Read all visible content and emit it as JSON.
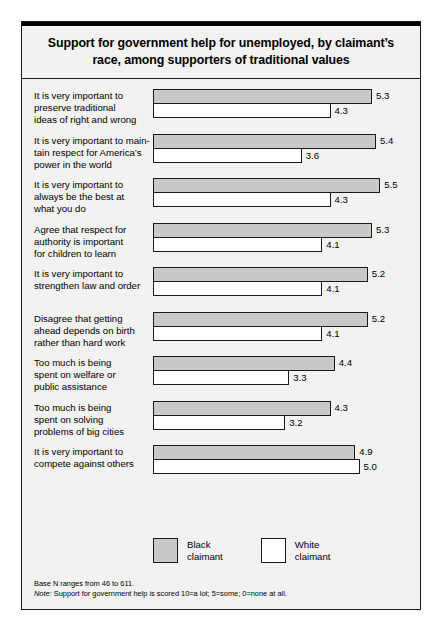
{
  "title": "Support for government help for unemployed, by claimant’s race, among supporters of traditional values",
  "legend": {
    "items": [
      {
        "label_line1": "Black",
        "label_line2": "claimant",
        "color": "#c9c9c7"
      },
      {
        "label_line1": "White",
        "label_line2": "claimant",
        "color": "#ffffff"
      }
    ]
  },
  "footnotes": {
    "base_n": "Base N ranges from 46 to 611.",
    "note_prefix": "Note:",
    "note_text": " Support for government help is scored 10=a lot; 5=some; 0=none at all."
  },
  "chart_data": {
    "type": "bar",
    "orientation": "horizontal",
    "title": "Support for government help for unemployed, by claimant’s race, among supporters of traditional values",
    "xlabel": "",
    "ylabel": "",
    "xlim": [
      0,
      5.8
    ],
    "grid": false,
    "legend_position": "bottom",
    "categories": [
      "It is very important to preserve traditional ideas of right and wrong",
      "It is very important to maintain respect for America’s power in the world",
      "It is very important to always be the best at what you do",
      "Agree that respect for authority is important for children to learn",
      "It is very important to strengthen law and order",
      "Disagree that getting ahead depends on birth rather than hard work",
      "Too much is being spent on welfare or public assistance",
      "Too much is being spent on solving problems of big cities",
      "It is very important to compete against others"
    ],
    "category_lines": [
      [
        "It is very important to",
        "preserve traditional",
        "ideas of right and wrong"
      ],
      [
        "It is very important to main-",
        "tain respect for America’s",
        "power in the world"
      ],
      [
        "It is very important to",
        "always be the best at",
        "what you do"
      ],
      [
        "Agree that respect for",
        "authority is important",
        "for children to learn"
      ],
      [
        "It is very important to",
        "strengthen law and order"
      ],
      [
        "Disagree that getting",
        "ahead depends on birth",
        "rather than hard work"
      ],
      [
        "Too much is being",
        "spent on welfare or",
        "public assistance"
      ],
      [
        "Too much is being",
        "spent on solving",
        "problems of big cities"
      ],
      [
        "It is very important to",
        "compete against others"
      ]
    ],
    "series": [
      {
        "name": "Black claimant",
        "color": "#c9c9c7",
        "values": [
          5.3,
          5.4,
          5.5,
          5.3,
          5.2,
          5.2,
          4.4,
          4.3,
          4.9
        ]
      },
      {
        "name": "White claimant",
        "color": "#ffffff",
        "values": [
          4.3,
          3.6,
          4.3,
          4.1,
          4.1,
          4.1,
          3.3,
          3.2,
          5.0
        ]
      }
    ]
  }
}
